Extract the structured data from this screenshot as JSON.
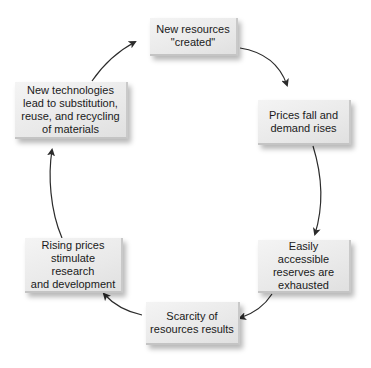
{
  "diagram": {
    "type": "cycle",
    "direction": "clockwise",
    "nodes": [
      {
        "id": "n1",
        "lines": [
          "New resources",
          "\"created\""
        ]
      },
      {
        "id": "n2",
        "lines": [
          "Prices fall and",
          "demand rises"
        ]
      },
      {
        "id": "n3",
        "lines": [
          "Easily accessible",
          "reserves are",
          "exhausted"
        ]
      },
      {
        "id": "n4",
        "lines": [
          "Scarcity of",
          "resources results"
        ]
      },
      {
        "id": "n5",
        "lines": [
          "Rising prices",
          "stimulate research",
          "and development"
        ]
      },
      {
        "id": "n6",
        "lines": [
          "New technologies",
          "lead to substitution,",
          "reuse, and recycling",
          "of materials"
        ]
      }
    ],
    "edges": [
      {
        "from": "n1",
        "to": "n2"
      },
      {
        "from": "n2",
        "to": "n3"
      },
      {
        "from": "n3",
        "to": "n4"
      },
      {
        "from": "n4",
        "to": "n5"
      },
      {
        "from": "n5",
        "to": "n6"
      },
      {
        "from": "n6",
        "to": "n1"
      }
    ],
    "colors": {
      "box_fill": "#ebebeb",
      "arrow": "#2b2b2b",
      "text": "#1a1a1a"
    }
  }
}
